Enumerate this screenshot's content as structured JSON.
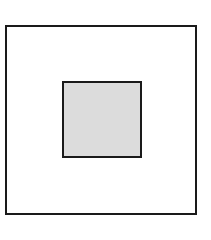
{
  "diagram": {
    "type": "nested-squares",
    "outer": {
      "shape": "square",
      "fill": "#ffffff",
      "stroke": "#1a1a1a"
    },
    "inner": {
      "shape": "square",
      "fill": "#dcdcdc",
      "stroke": "#1a1a1a"
    }
  }
}
